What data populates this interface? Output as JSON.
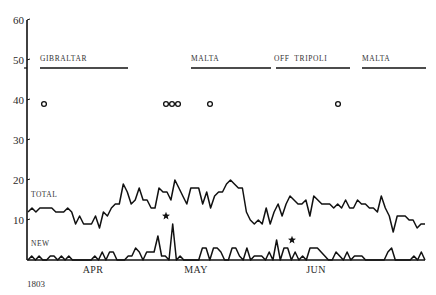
{
  "chart_data": {
    "type": "line",
    "title": "",
    "xlabel": "",
    "ylabel": "",
    "year_label": "1803",
    "ylim": [
      0,
      60
    ],
    "yticks": [
      10,
      20,
      30,
      40,
      50,
      60
    ],
    "x_month_labels": [
      {
        "label": "APR",
        "x": 93
      },
      {
        "label": "MAY",
        "x": 196
      },
      {
        "label": "JUN",
        "x": 316
      }
    ],
    "x_pixel_range": [
      27,
      425
    ],
    "series": [
      {
        "name": "TOTAL",
        "label_pos": {
          "x": 31,
          "y": 197
        },
        "values": [
          12,
          13,
          12,
          13,
          13,
          13,
          13,
          12,
          12,
          12,
          13,
          12,
          9,
          11,
          9,
          9,
          9,
          11,
          8,
          12,
          11,
          13,
          14,
          14,
          19,
          17,
          14,
          15,
          18,
          15,
          15,
          13,
          13,
          18,
          17,
          17,
          15,
          20,
          18,
          16,
          14,
          18,
          18,
          18,
          14,
          17,
          13,
          16,
          17,
          17,
          19,
          20,
          19,
          18,
          18,
          12,
          10,
          9,
          10,
          9,
          13,
          9,
          12,
          14,
          11,
          14,
          16,
          15,
          14,
          14,
          15,
          11,
          16,
          15,
          14,
          14,
          14,
          13,
          14,
          13,
          15,
          13,
          13,
          15,
          14,
          14,
          13,
          13,
          12,
          16,
          13,
          11,
          7,
          11,
          11,
          11,
          10,
          10,
          8,
          9,
          9
        ]
      },
      {
        "name": "NEW",
        "label_pos": {
          "x": 31,
          "y": 246
        },
        "values": [
          0,
          1,
          0,
          1,
          0,
          0,
          1,
          1,
          0,
          1,
          0,
          1,
          0,
          0,
          0,
          0,
          0,
          0,
          1,
          0,
          2,
          0,
          2,
          2,
          0,
          0,
          0,
          1,
          1,
          3,
          2,
          0,
          2,
          2,
          2,
          6,
          1,
          1,
          0,
          9,
          0,
          1,
          0,
          0,
          0,
          0,
          0,
          3,
          3,
          0,
          3,
          3,
          2,
          0,
          0,
          3,
          3,
          1,
          0,
          3,
          0,
          1,
          1,
          1,
          0,
          2,
          0,
          5,
          0,
          3,
          3,
          0,
          2,
          0,
          1,
          0,
          3,
          3,
          3,
          2,
          1,
          0,
          0,
          2,
          1,
          0,
          2,
          0,
          1,
          1,
          1,
          0,
          0,
          0,
          0,
          0,
          0,
          2,
          3,
          0,
          0,
          0,
          0,
          0,
          1,
          0,
          2,
          0
        ]
      }
    ],
    "markers": {
      "stars": [
        {
          "x": 166,
          "value": 11
        },
        {
          "x": 292,
          "value": 5
        }
      ],
      "circles": [
        {
          "x": 44,
          "value": 39
        },
        {
          "x": 166,
          "value": 39
        },
        {
          "x": 172,
          "value": 39
        },
        {
          "x": 178,
          "value": 39
        },
        {
          "x": 210,
          "value": 39
        },
        {
          "x": 338,
          "value": 39
        }
      ]
    },
    "location_periods": [
      {
        "label": "GIBRALTAR",
        "x_start": 40,
        "x_end": 128,
        "label_x": 40
      },
      {
        "label": "MALTA",
        "x_start": 191,
        "x_end": 271,
        "label_x": 191
      },
      {
        "label": "OFF  TRIPOLI",
        "x_start": 276,
        "x_end": 350,
        "label_x": 274
      },
      {
        "label": "MALTA",
        "x_start": 362,
        "x_end": 426,
        "label_x": 362
      }
    ],
    "location_bar_value": 48,
    "grid": false,
    "legend": "inline labels"
  }
}
